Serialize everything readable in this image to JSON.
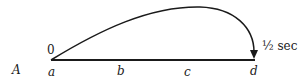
{
  "diagram": {
    "row_label": "A",
    "start_time": "0",
    "end_time": "½ sec",
    "points": [
      "a",
      "b",
      "c",
      "d"
    ],
    "colors": {
      "ink": "#1a1a1a",
      "background": "#ffffff"
    }
  }
}
